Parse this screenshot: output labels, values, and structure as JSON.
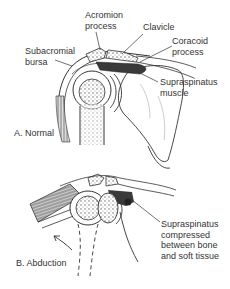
{
  "figure": {
    "panels": [
      {
        "id": "A",
        "caption": "A. Normal",
        "labels": [
          {
            "key": "acromion",
            "lines": [
              "Acromion",
              "process"
            ]
          },
          {
            "key": "clavicle",
            "lines": [
              "Clavicle"
            ]
          },
          {
            "key": "coracoid",
            "lines": [
              "Coracoid",
              "process"
            ]
          },
          {
            "key": "bursa",
            "lines": [
              "Subacromial",
              "bursa"
            ]
          },
          {
            "key": "supraspinatus",
            "lines": [
              "Supraspinatus",
              "muscle"
            ]
          }
        ]
      },
      {
        "id": "B",
        "caption": "B. Abduction",
        "labels": [
          {
            "key": "compressed",
            "lines": [
              "Supraspinatus",
              "compressed",
              "between bone",
              "and soft tissue"
            ]
          }
        ]
      }
    ],
    "colors": {
      "line": "#2a2a2a",
      "bone_fill": "#ffffff",
      "shade": "#555555",
      "muscle_dark": "#3a3a3a"
    }
  }
}
